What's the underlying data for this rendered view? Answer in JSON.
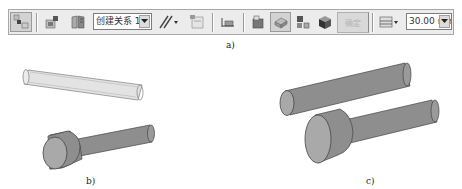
{
  "toolbar": {
    "relation_combo": {
      "value": "创建关系 1",
      "icon": "dropdown-arrow-icon"
    },
    "ok_button_label": "确定",
    "ok_button_state": "disabled",
    "distance_combo": {
      "value": "30.00 mm",
      "icon": "dropdown-arrow-icon"
    },
    "buttons": [
      {
        "name": "select-tool",
        "icon": "select-parts-icon",
        "state": "pressed"
      },
      {
        "name": "place-part",
        "icon": "place-part-icon"
      },
      {
        "name": "book-options",
        "icon": "book-icon"
      },
      {
        "name": "relation-type",
        "icon": "parallel-lines-icon",
        "has_dropdown": true
      },
      {
        "name": "construction-display",
        "icon": "construction-icon"
      },
      {
        "name": "flip-offset",
        "icon": "flip-icon"
      },
      {
        "name": "select-face",
        "icon": "face-select-icon"
      },
      {
        "name": "select-part",
        "icon": "part-select-icon",
        "state": "pressed"
      },
      {
        "name": "select-subassembly",
        "icon": "subassembly-icon"
      },
      {
        "name": "select-body",
        "icon": "body-icon"
      },
      {
        "name": "offset-type",
        "icon": "offset-type-icon",
        "has_dropdown": true
      }
    ]
  },
  "captions": {
    "a": "a)",
    "b": "b)",
    "c": "c)"
  },
  "colors": {
    "toolbar_bg": "#ececec",
    "part_fill": "#8e8e8e",
    "part_end": "#a9a9a9",
    "transparent_part": "#e0e0e0"
  }
}
